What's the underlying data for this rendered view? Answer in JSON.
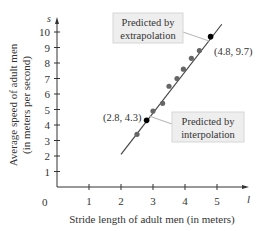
{
  "chart_data": {
    "type": "scatter",
    "title": "",
    "xlabel": "Stride length of adult men (in meters)",
    "ylabel_line1": "Average speed of adult men",
    "ylabel_line2": "(in meters per second)",
    "x_axis_symbol": "l",
    "y_axis_symbol": "s",
    "origin_label": "0",
    "xlim": [
      0,
      5.6
    ],
    "ylim": [
      0,
      10.5
    ],
    "x_ticks": [
      "1",
      "2",
      "3",
      "4",
      "5"
    ],
    "y_ticks": [
      "1",
      "2",
      "3",
      "4",
      "5",
      "6",
      "7",
      "8",
      "9",
      "10"
    ],
    "grid": false,
    "observed_points": [
      {
        "x": 2.5,
        "y": 3.4
      },
      {
        "x": 3.0,
        "y": 4.9
      },
      {
        "x": 3.3,
        "y": 5.4
      },
      {
        "x": 3.5,
        "y": 6.5
      },
      {
        "x": 3.75,
        "y": 7.0
      },
      {
        "x": 3.95,
        "y": 7.6
      },
      {
        "x": 4.2,
        "y": 8.3
      },
      {
        "x": 4.45,
        "y": 8.8
      }
    ],
    "regression_line": {
      "x_start": 2.0,
      "y_start": 2.1,
      "x_end": 5.15,
      "y_end": 10.5
    },
    "highlighted_points": [
      {
        "x": 2.8,
        "y": 4.3,
        "label": "(2.8, 4.3)",
        "annotation": "Predicted by interpolation"
      },
      {
        "x": 4.8,
        "y": 9.7,
        "label": "(4.8, 9.7)",
        "annotation": "Predicted by extrapolation"
      }
    ],
    "annotations": {
      "extrapolation": {
        "line1": "Predicted by",
        "line2": "extrapolation"
      },
      "interpolation": {
        "line1": "Predicted by",
        "line2": "interpolation"
      }
    }
  }
}
